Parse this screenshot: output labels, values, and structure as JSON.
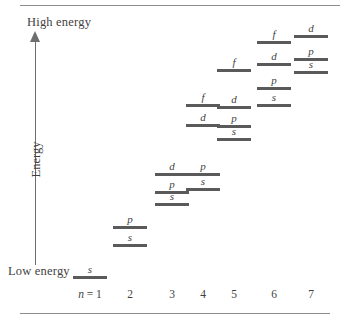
{
  "figure": {
    "axis": {
      "high_energy_label": "High energy",
      "low_energy_label": "Low energy",
      "energy_label": "Energy",
      "n_prefix": "n = "
    },
    "colors": {
      "level_bar": "#5a5a5a",
      "text": "#3f3f3f",
      "rule": "#8d8d8d",
      "axis": "#6e6e6e",
      "background": "#ffffff"
    }
  },
  "columns": [
    {
      "n": "1",
      "label": "n = 1",
      "x": 90
    },
    {
      "n": "2",
      "label": "2",
      "x": 130
    },
    {
      "n": "3",
      "label": "3",
      "x": 172
    },
    {
      "n": "4",
      "label": "4",
      "x": 203
    },
    {
      "n": "5",
      "label": "5",
      "x": 234
    },
    {
      "n": "6",
      "label": "6",
      "x": 274
    },
    {
      "n": "7",
      "label": "7",
      "x": 311
    }
  ],
  "chart_data": {
    "type": "scatter",
    "xlabel": "n",
    "ylabel": "Energy",
    "grid": false,
    "legend": null,
    "xticklabels": [
      "n = 1",
      "2",
      "3",
      "4",
      "5",
      "6",
      "7"
    ],
    "yticklabels": [
      "Low energy",
      "High energy"
    ],
    "annotations": [
      "High energy",
      "Low energy",
      "Energy"
    ],
    "note": "y values are pixel positions of each level bar (smaller y = higher energy)",
    "levels": [
      {
        "n": "1",
        "orbital": "s",
        "x": 90,
        "y": 276
      },
      {
        "n": "2",
        "orbital": "p",
        "x": 130,
        "y": 226
      },
      {
        "n": "2",
        "orbital": "s",
        "x": 130,
        "y": 244
      },
      {
        "n": "3",
        "orbital": "d",
        "x": 172,
        "y": 173
      },
      {
        "n": "3",
        "orbital": "p",
        "x": 172,
        "y": 191
      },
      {
        "n": "3",
        "orbital": "s",
        "x": 172,
        "y": 203
      },
      {
        "n": "4",
        "orbital": "f",
        "x": 203,
        "y": 104
      },
      {
        "n": "4",
        "orbital": "d",
        "x": 203,
        "y": 124
      },
      {
        "n": "4",
        "orbital": "p",
        "x": 203,
        "y": 173
      },
      {
        "n": "4",
        "orbital": "s",
        "x": 203,
        "y": 188
      },
      {
        "n": "5",
        "orbital": "f",
        "x": 234,
        "y": 69
      },
      {
        "n": "5",
        "orbital": "d",
        "x": 234,
        "y": 106
      },
      {
        "n": "5",
        "orbital": "p",
        "x": 234,
        "y": 125
      },
      {
        "n": "5",
        "orbital": "s",
        "x": 234,
        "y": 138
      },
      {
        "n": "6",
        "orbital": "f",
        "x": 274,
        "y": 41
      },
      {
        "n": "6",
        "orbital": "d",
        "x": 274,
        "y": 63
      },
      {
        "n": "6",
        "orbital": "p",
        "x": 274,
        "y": 87
      },
      {
        "n": "6",
        "orbital": "s",
        "x": 274,
        "y": 104
      },
      {
        "n": "7",
        "orbital": "d",
        "x": 311,
        "y": 35
      },
      {
        "n": "7",
        "orbital": "p",
        "x": 311,
        "y": 58
      },
      {
        "n": "7",
        "orbital": "s",
        "x": 311,
        "y": 71
      }
    ]
  }
}
